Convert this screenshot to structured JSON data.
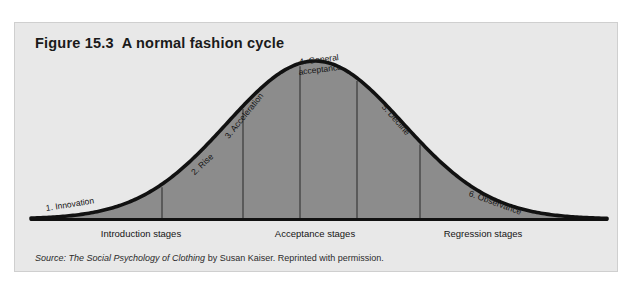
{
  "figure": {
    "number": "Figure 15.3",
    "title": "A normal fashion cycle",
    "title_full": "Figure 15.3  A normal fashion cycle",
    "source_prefix": "Source:",
    "source_italic": "The Social Psychology of Clothing",
    "source_rest": "by Susan Kaiser. Reprinted with permission.",
    "background_color": "#e8e8e8",
    "curve_color": "#111111",
    "fill_color": "#8c8c8c",
    "divider_color": "#3a3a3a"
  },
  "chart_data": {
    "type": "area",
    "title": "A normal fashion cycle",
    "xlabel": "",
    "ylabel": "",
    "grid": false,
    "legend": "none",
    "curve_shape": "normal distribution (bell curve)",
    "baseline_y_px": 196,
    "peak_x_px": 300,
    "peak_y_px": 38,
    "x": [
      16,
      40,
      70,
      100,
      130,
      160,
      190,
      215,
      242,
      270,
      300,
      330,
      358,
      385,
      418,
      450,
      480,
      520,
      560,
      590
    ],
    "y": [
      194,
      192,
      188,
      181,
      169,
      151,
      126,
      98,
      75,
      50,
      38,
      50,
      75,
      98,
      126,
      151,
      169,
      183,
      190,
      194
    ],
    "dividers_x": [
      147,
      228,
      285,
      342,
      405
    ],
    "stage_labels": [
      {
        "id": "innovation",
        "text": "1. Innovation",
        "left": 31,
        "top": 181,
        "rotate": -9,
        "lines": [
          "1. Innovation"
        ]
      },
      {
        "id": "rise",
        "text": "2. Rise",
        "left": 178,
        "top": 146,
        "rotate": -43,
        "lines": [
          "2. Rise"
        ]
      },
      {
        "id": "acceleration",
        "text": "3. Acceleration",
        "left": 212,
        "top": 110,
        "rotate": -51,
        "lines": [
          "3. Acceleration"
        ]
      },
      {
        "id": "general",
        "text": "4. General acceptance",
        "left": 283,
        "top": 35,
        "rotate": -7,
        "lines": [
          "4. General",
          "acceptance"
        ]
      },
      {
        "id": "decline",
        "text": "5. Decline",
        "left": 368,
        "top": 78,
        "rotate": 49,
        "lines": [
          "5. Decline"
        ]
      },
      {
        "id": "observance",
        "text": "6. Observance",
        "left": 454,
        "top": 166,
        "rotate": 20,
        "lines": [
          "6. Observance"
        ]
      }
    ],
    "group_labels": [
      {
        "id": "introduction",
        "text": "Introduction stages",
        "center_x": 126,
        "top": 205
      },
      {
        "id": "acceptance",
        "text": "Acceptance stages",
        "center_x": 300,
        "top": 205
      },
      {
        "id": "regression",
        "text": "Regression stages",
        "center_x": 468,
        "top": 205
      }
    ]
  }
}
